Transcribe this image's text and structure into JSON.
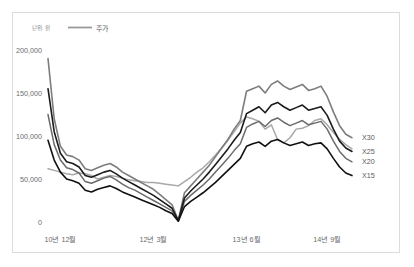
{
  "frame": {
    "border_color": "#dcdcdc",
    "background": "#ffffff"
  },
  "legend": {
    "unit_label": "단위: 원",
    "entries": [
      {
        "label": "주가",
        "color": "#9a9a9a"
      }
    ]
  },
  "series_end_labels": [
    {
      "label": "X30",
      "color": "#777777"
    },
    {
      "label": "X25",
      "color": "#1a1a1a"
    },
    {
      "label": "X20",
      "color": "#6e6e6e"
    },
    {
      "label": "X15",
      "color": "#111111"
    }
  ],
  "chart_data": {
    "type": "line",
    "title": "",
    "subtitle": "",
    "xlabel": "",
    "ylabel": "단위: 원",
    "ylim": [
      0,
      200000
    ],
    "yticks": [
      0,
      50000,
      100000,
      150000,
      200000
    ],
    "ytick_labels": [
      "0",
      "50,000",
      "100,000",
      "150,000",
      "200,000"
    ],
    "xtick_labels": [
      "10년 12월",
      "12년 3월",
      "13년 6월",
      "14년 9월"
    ],
    "xtick_positions": [
      2,
      17,
      32,
      45
    ],
    "grid": false,
    "legend_position": "top-left",
    "x_count": 50,
    "series": [
      {
        "name": "주가",
        "color": "#a8a8a8",
        "width": 1.5,
        "values": [
          62000,
          60000,
          58000,
          56000,
          55000,
          57000,
          56000,
          54000,
          50000,
          52000,
          54000,
          53000,
          51000,
          49000,
          48000,
          47000,
          46000,
          46000,
          45000,
          44000,
          43000,
          42000,
          47000,
          52000,
          58000,
          63000,
          70000,
          78000,
          86000,
          95000,
          105000,
          115000,
          122000,
          120000,
          117000,
          108000,
          113000,
          96000,
          92000,
          98000,
          108000,
          109000,
          112000,
          118000,
          120000,
          113000,
          104000,
          96000,
          90000,
          85000
        ]
      },
      {
        "name": "X30",
        "color": "#7d7d7d",
        "width": 1.6,
        "values": [
          190000,
          120000,
          88000,
          78000,
          76000,
          72000,
          62000,
          60000,
          63000,
          66000,
          68000,
          64000,
          58000,
          54000,
          50000,
          46000,
          42000,
          38000,
          32000,
          26000,
          20000,
          2000,
          34000,
          42000,
          50000,
          58000,
          66000,
          76000,
          86000,
          96000,
          108000,
          118000,
          152000,
          155000,
          158000,
          150000,
          160000,
          164000,
          158000,
          154000,
          157000,
          160000,
          153000,
          155000,
          158000,
          146000,
          128000,
          112000,
          102000,
          98000
        ]
      },
      {
        "name": "X25",
        "color": "#1b1b1b",
        "width": 1.6,
        "values": [
          155000,
          105000,
          80000,
          70000,
          68000,
          64000,
          54000,
          52000,
          55000,
          58000,
          60000,
          56000,
          51000,
          47000,
          43000,
          39000,
          35000,
          31000,
          26000,
          21000,
          16000,
          1500,
          28000,
          36000,
          43000,
          50000,
          58000,
          67000,
          76000,
          85000,
          95000,
          104000,
          126000,
          130000,
          134000,
          127000,
          136000,
          139000,
          134000,
          130000,
          133000,
          136000,
          130000,
          132000,
          134000,
          124000,
          108000,
          94000,
          86000,
          82000
        ]
      },
      {
        "name": "X20",
        "color": "#6b6b6b",
        "width": 1.5,
        "values": [
          125000,
          90000,
          72000,
          63000,
          61000,
          57000,
          47000,
          45000,
          48000,
          51000,
          53000,
          49000,
          44000,
          40000,
          37000,
          33000,
          29000,
          25000,
          21000,
          17000,
          13000,
          1200,
          24000,
          31000,
          37000,
          43000,
          50000,
          58000,
          66000,
          74000,
          83000,
          91000,
          110000,
          114000,
          117000,
          111000,
          118000,
          121000,
          116000,
          112000,
          115000,
          118000,
          113000,
          115000,
          117000,
          108000,
          94000,
          82000,
          74000,
          70000
        ]
      },
      {
        "name": "X15",
        "color": "#101010",
        "width": 1.6,
        "values": [
          95000,
          72000,
          58000,
          50000,
          48000,
          45000,
          37000,
          35000,
          38000,
          40000,
          42000,
          39000,
          35000,
          32000,
          29000,
          26000,
          23000,
          20000,
          17000,
          13000,
          10000,
          900,
          18000,
          24000,
          29000,
          34000,
          40000,
          46000,
          53000,
          60000,
          67000,
          74000,
          88000,
          91000,
          93000,
          88000,
          94000,
          96000,
          92000,
          89000,
          91000,
          93000,
          89000,
          91000,
          92000,
          85000,
          74000,
          64000,
          57000,
          54000
        ]
      }
    ]
  }
}
